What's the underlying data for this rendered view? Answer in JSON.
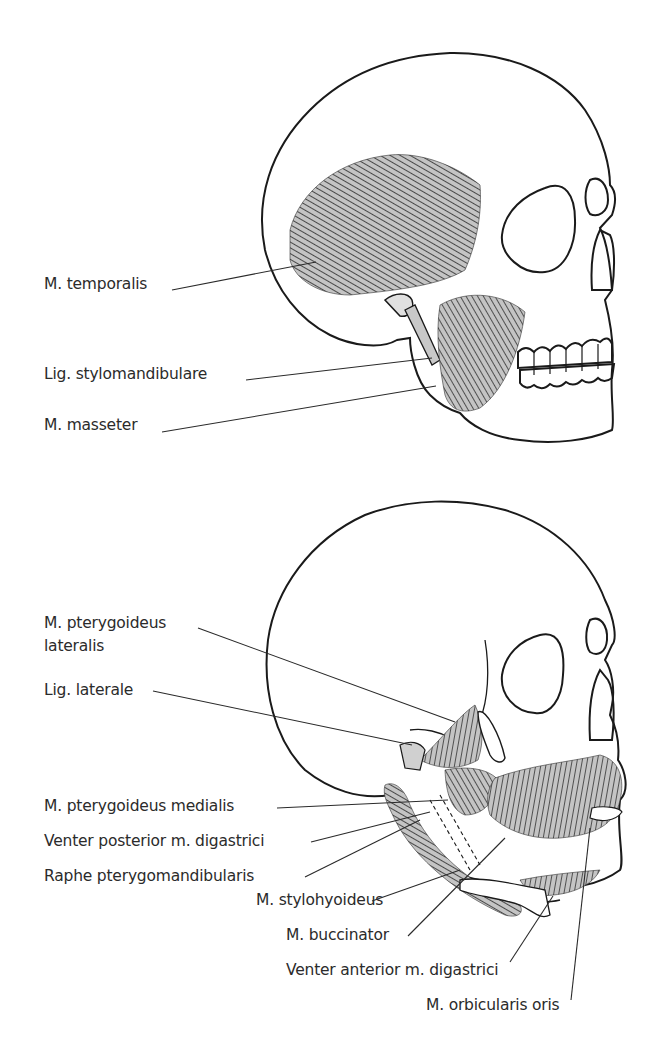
{
  "figure": {
    "upper_panel": {
      "labels": [
        {
          "text": "M. temporalis",
          "x": 44,
          "y": 284
        },
        {
          "text": "Lig. stylomandibulare",
          "x": 44,
          "y": 374
        },
        {
          "text": "M. masseter",
          "x": 44,
          "y": 424
        }
      ]
    },
    "lower_panel": {
      "labels": [
        {
          "text": "M. pterygoideus",
          "x": 44,
          "y": 619
        },
        {
          "text": "lateralis",
          "x": 44,
          "y": 642
        },
        {
          "text": "Lig. laterale",
          "x": 44,
          "y": 686
        },
        {
          "text": "M. pterygoideus medialis",
          "x": 44,
          "y": 803
        },
        {
          "text": "Venter posterior m. digastrici",
          "x": 44,
          "y": 838
        },
        {
          "text": "Raphe pterygomandibularis",
          "x": 44,
          "y": 873
        },
        {
          "text": "M. stylohyoideus",
          "x": 256,
          "y": 897
        },
        {
          "text": "M. buccinator",
          "x": 286,
          "y": 932
        },
        {
          "text": "Venter anterior m. digastrici",
          "x": 286,
          "y": 967
        },
        {
          "text": "M. orbicularis oris",
          "x": 426,
          "y": 1002
        }
      ]
    },
    "colors": {
      "line": "#1a1a1a",
      "muscle_fill": "#bdbdbd",
      "muscle_stroke": "#2a2a2a",
      "text": "#2b2b2b"
    }
  }
}
